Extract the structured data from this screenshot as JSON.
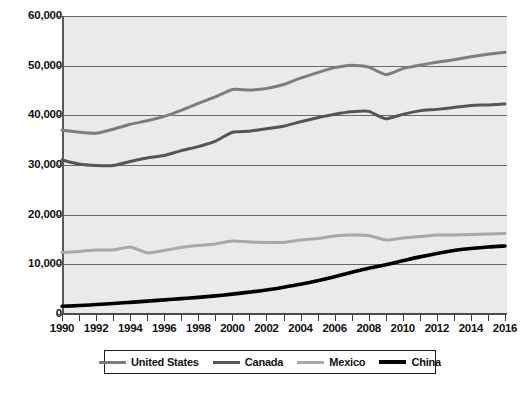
{
  "chart_data": {
    "type": "line",
    "title": "",
    "subtitle": "",
    "xlabel": "",
    "ylabel": "",
    "xlim": [
      1990,
      2016
    ],
    "ylim": [
      0,
      60000
    ],
    "grid": true,
    "legend_position": "bottom",
    "y_ticks": [
      0,
      10000,
      20000,
      30000,
      40000,
      50000,
      60000
    ],
    "y_tick_labels": [
      "0",
      "10,000",
      "20,000",
      "30,000",
      "40,000",
      "50,000",
      "60,000"
    ],
    "x": [
      1990,
      1991,
      1992,
      1993,
      1994,
      1995,
      1996,
      1997,
      1998,
      1999,
      2000,
      2001,
      2002,
      2003,
      2004,
      2005,
      2006,
      2007,
      2008,
      2009,
      2010,
      2011,
      2012,
      2013,
      2014,
      2015,
      2016
    ],
    "x_tick_labels": [
      "1990",
      "1992",
      "1994",
      "1996",
      "1998",
      "2000",
      "2002",
      "2004",
      "2006",
      "2008",
      "2010",
      "2012",
      "2014",
      "2016"
    ],
    "x_tick_values": [
      1990,
      1992,
      1994,
      1996,
      1998,
      2000,
      2002,
      2004,
      2006,
      2008,
      2010,
      2012,
      2014,
      2016
    ],
    "series": [
      {
        "name": "United States",
        "color": "#7d7d7d",
        "width": 3,
        "values": [
          37000,
          36600,
          36400,
          37200,
          38200,
          38900,
          39800,
          41000,
          42400,
          43700,
          45200,
          45100,
          45400,
          46200,
          47500,
          48600,
          49600,
          50100,
          49700,
          48200,
          49400,
          50100,
          50700,
          51200,
          51800,
          52300,
          52700
        ]
      },
      {
        "name": "Canada",
        "color": "#555555",
        "width": 3,
        "values": [
          31000,
          30200,
          29900,
          29900,
          30700,
          31400,
          31900,
          32900,
          33700,
          34800,
          36600,
          36800,
          37300,
          37800,
          38700,
          39500,
          40200,
          40700,
          40800,
          39300,
          40200,
          40900,
          41200,
          41600,
          42000,
          42100,
          42300
        ]
      },
      {
        "name": "Mexico",
        "color": "#a8a8a8",
        "width": 3,
        "values": [
          12400,
          12600,
          12900,
          12900,
          13500,
          12300,
          12800,
          13400,
          13800,
          14100,
          14700,
          14500,
          14400,
          14400,
          14900,
          15200,
          15700,
          15900,
          15800,
          14900,
          15300,
          15600,
          15900,
          15900,
          16000,
          16100,
          16200
        ]
      },
      {
        "name": "China",
        "color": "#000000",
        "width": 3.6,
        "values": [
          1550,
          1700,
          1900,
          2100,
          2350,
          2600,
          2850,
          3100,
          3350,
          3650,
          4000,
          4400,
          4850,
          5400,
          6000,
          6700,
          7500,
          8400,
          9200,
          9900,
          10700,
          11500,
          12200,
          12800,
          13200,
          13500,
          13700
        ]
      }
    ]
  },
  "legend": {
    "items": [
      {
        "label": "United States",
        "color": "#7d7d7d",
        "thickness": "3px"
      },
      {
        "label": "Canada",
        "color": "#555555",
        "thickness": "3px"
      },
      {
        "label": "Mexico",
        "color": "#a8a8a8",
        "thickness": "3px"
      },
      {
        "label": "China",
        "color": "#000000",
        "thickness": "3.6px"
      }
    ]
  },
  "colors": {
    "plot_background": "#eaeaea",
    "page_background": "#ffffff",
    "axis": "#4a4a4a",
    "gridline": "#6a6a6a",
    "text": "#111111"
  }
}
